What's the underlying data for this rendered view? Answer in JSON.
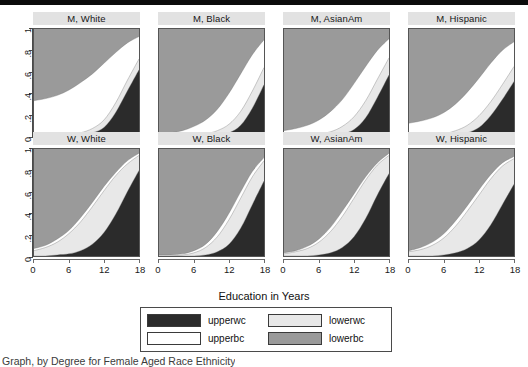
{
  "figure": {
    "xlabel": "Education in Years",
    "caption": "Graph, by Degree for Female Aged Race Ethnicity"
  },
  "colors": {
    "upperwc": "#2b2b2b",
    "upperbc": "#ffffff",
    "lowerwc": "#e8e8e8",
    "lowerbc": "#9a9a9a",
    "strip": "#e2e2e2",
    "frame": "#555555",
    "topbar": "#0b0b0b"
  },
  "axes": {
    "y_ticks": [
      "0",
      ".2",
      ".4",
      ".6",
      ".8",
      "1"
    ],
    "y_values": [
      0,
      0.2,
      0.4,
      0.6,
      0.8,
      1
    ],
    "ylim": [
      0,
      1
    ],
    "x_ticks": [
      "0",
      "6",
      "12",
      "18"
    ],
    "x_values": [
      0,
      6,
      12,
      18
    ],
    "xlim": [
      0,
      18
    ]
  },
  "legend": {
    "items": [
      {
        "label": "upperwc",
        "color": "#2b2b2b"
      },
      {
        "label": "lowerwc",
        "color": "#e8e8e8"
      },
      {
        "label": "upperbc",
        "color": "#ffffff"
      },
      {
        "label": "lowerbc",
        "color": "#9a9a9a"
      }
    ]
  },
  "chart_data": {
    "type": "area",
    "title": "",
    "xlabel": "Education in Years",
    "ylabel": "",
    "xlim": [
      0,
      18
    ],
    "ylim": [
      0,
      1
    ],
    "grid": false,
    "legend_position": "bottom",
    "stacking": "cumulative-from-bottom",
    "series_order": [
      "upperwc",
      "lowerwc",
      "upperbc",
      "lowerbc"
    ],
    "series_colors": {
      "upperwc": "#2b2b2b",
      "lowerwc": "#e8e8e8",
      "upperbc": "#ffffff",
      "lowerbc": "#9a9a9a"
    },
    "x": [
      0,
      2,
      4,
      6,
      8,
      10,
      12,
      14,
      16,
      18
    ],
    "panels": [
      {
        "label": "M, White",
        "row": 0,
        "col": 0,
        "boundaries": {
          "upperwc": [
            0.0,
            0.0,
            0.0,
            0.0,
            0.01,
            0.03,
            0.08,
            0.22,
            0.42,
            0.62
          ],
          "lowerwc": [
            0.0,
            0.0,
            0.0,
            0.01,
            0.03,
            0.07,
            0.15,
            0.31,
            0.52,
            0.72
          ],
          "upperbc": [
            0.33,
            0.35,
            0.38,
            0.43,
            0.5,
            0.58,
            0.68,
            0.78,
            0.87,
            0.93
          ],
          "lowerbc": [
            1.0,
            1.0,
            1.0,
            1.0,
            1.0,
            1.0,
            1.0,
            1.0,
            1.0,
            1.0
          ]
        }
      },
      {
        "label": "M, Black",
        "row": 0,
        "col": 1,
        "boundaries": {
          "upperwc": [
            0.0,
            0.0,
            0.0,
            0.0,
            0.0,
            0.01,
            0.03,
            0.1,
            0.26,
            0.48
          ],
          "lowerwc": [
            0.0,
            0.0,
            0.0,
            0.01,
            0.02,
            0.05,
            0.11,
            0.23,
            0.42,
            0.64
          ],
          "upperbc": [
            0.02,
            0.03,
            0.05,
            0.09,
            0.15,
            0.25,
            0.4,
            0.58,
            0.76,
            0.9
          ],
          "lowerbc": [
            1.0,
            1.0,
            1.0,
            1.0,
            1.0,
            1.0,
            1.0,
            1.0,
            1.0,
            1.0
          ]
        }
      },
      {
        "label": "M, AsianAm",
        "row": 0,
        "col": 2,
        "boundaries": {
          "upperwc": [
            0.0,
            0.0,
            0.0,
            0.0,
            0.01,
            0.02,
            0.06,
            0.17,
            0.36,
            0.57
          ],
          "lowerwc": [
            0.0,
            0.0,
            0.01,
            0.02,
            0.04,
            0.09,
            0.18,
            0.33,
            0.53,
            0.73
          ],
          "upperbc": [
            0.05,
            0.07,
            0.1,
            0.15,
            0.23,
            0.34,
            0.49,
            0.65,
            0.8,
            0.91
          ],
          "lowerbc": [
            1.0,
            1.0,
            1.0,
            1.0,
            1.0,
            1.0,
            1.0,
            1.0,
            1.0,
            1.0
          ]
        }
      },
      {
        "label": "M, Hispanic",
        "row": 0,
        "col": 3,
        "boundaries": {
          "upperwc": [
            0.0,
            0.0,
            0.0,
            0.0,
            0.01,
            0.03,
            0.08,
            0.19,
            0.34,
            0.51
          ],
          "lowerwc": [
            0.0,
            0.0,
            0.01,
            0.02,
            0.05,
            0.1,
            0.19,
            0.32,
            0.48,
            0.65
          ],
          "upperbc": [
            0.12,
            0.14,
            0.17,
            0.22,
            0.3,
            0.41,
            0.54,
            0.68,
            0.8,
            0.88
          ],
          "lowerbc": [
            1.0,
            1.0,
            1.0,
            1.0,
            1.0,
            1.0,
            1.0,
            1.0,
            1.0,
            1.0
          ]
        }
      },
      {
        "label": "W, White",
        "row": 1,
        "col": 0,
        "boundaries": {
          "upperwc": [
            0.0,
            0.0,
            0.01,
            0.02,
            0.05,
            0.11,
            0.22,
            0.39,
            0.6,
            0.8
          ],
          "lowerwc": [
            0.05,
            0.08,
            0.13,
            0.21,
            0.32,
            0.46,
            0.61,
            0.75,
            0.86,
            0.94
          ],
          "upperbc": [
            0.07,
            0.1,
            0.16,
            0.24,
            0.36,
            0.5,
            0.65,
            0.78,
            0.89,
            0.96
          ],
          "lowerbc": [
            1.0,
            1.0,
            1.0,
            1.0,
            1.0,
            1.0,
            1.0,
            1.0,
            1.0,
            1.0
          ]
        }
      },
      {
        "label": "W, Black",
        "row": 1,
        "col": 1,
        "boundaries": {
          "upperwc": [
            0.0,
            0.0,
            0.0,
            0.0,
            0.01,
            0.04,
            0.11,
            0.26,
            0.48,
            0.7
          ],
          "lowerwc": [
            0.0,
            0.0,
            0.01,
            0.03,
            0.08,
            0.18,
            0.34,
            0.54,
            0.74,
            0.89
          ],
          "upperbc": [
            0.01,
            0.01,
            0.02,
            0.05,
            0.11,
            0.23,
            0.4,
            0.6,
            0.79,
            0.92
          ],
          "lowerbc": [
            1.0,
            1.0,
            1.0,
            1.0,
            1.0,
            1.0,
            1.0,
            1.0,
            1.0,
            1.0
          ]
        }
      },
      {
        "label": "W, AsianAm",
        "row": 1,
        "col": 2,
        "boundaries": {
          "upperwc": [
            0.0,
            0.0,
            0.0,
            0.01,
            0.03,
            0.08,
            0.18,
            0.35,
            0.57,
            0.77
          ],
          "lowerwc": [
            0.02,
            0.04,
            0.07,
            0.13,
            0.23,
            0.37,
            0.54,
            0.71,
            0.85,
            0.94
          ],
          "upperbc": [
            0.03,
            0.05,
            0.09,
            0.16,
            0.27,
            0.42,
            0.58,
            0.74,
            0.87,
            0.96
          ],
          "lowerbc": [
            1.0,
            1.0,
            1.0,
            1.0,
            1.0,
            1.0,
            1.0,
            1.0,
            1.0,
            1.0
          ]
        }
      },
      {
        "label": "W, Hispanic",
        "row": 1,
        "col": 3,
        "boundaries": {
          "upperwc": [
            0.0,
            0.0,
            0.0,
            0.01,
            0.03,
            0.07,
            0.15,
            0.29,
            0.48,
            0.67
          ],
          "lowerwc": [
            0.04,
            0.06,
            0.1,
            0.17,
            0.28,
            0.42,
            0.57,
            0.72,
            0.84,
            0.91
          ],
          "upperbc": [
            0.05,
            0.08,
            0.13,
            0.21,
            0.33,
            0.47,
            0.62,
            0.76,
            0.87,
            0.93
          ],
          "lowerbc": [
            1.0,
            1.0,
            1.0,
            1.0,
            1.0,
            1.0,
            1.0,
            1.0,
            1.0,
            1.0
          ]
        }
      }
    ]
  }
}
